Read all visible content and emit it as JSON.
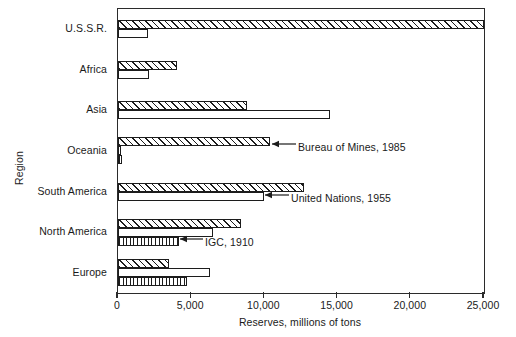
{
  "chart_data": {
    "type": "bar",
    "orientation": "horizontal",
    "title": "",
    "subtitle": "",
    "xlabel": "Reserves, millions of tons",
    "ylabel": "Region",
    "xlim": [
      0,
      25000
    ],
    "xticks": [
      0,
      5000,
      10000,
      15000,
      20000,
      25000
    ],
    "xticklabels": [
      "0",
      "5,000",
      "10,000",
      "15,000",
      "20,000",
      "25,000"
    ],
    "grid": false,
    "legend_position": "inline-annotations",
    "categories": [
      "U.S.S.R.",
      "Africa",
      "Asia",
      "Oceania",
      "South America",
      "North America",
      "Europe"
    ],
    "series": [
      {
        "name": "Bureau of Mines, 1985",
        "pattern": "diagonal-hatch",
        "values": [
          25000,
          4000,
          8800,
          10400,
          12700,
          8400,
          3500
        ]
      },
      {
        "name": "United Nations, 1955",
        "pattern": "dotted",
        "values": [
          2050,
          2100,
          14500,
          200,
          10000,
          6500,
          6300
        ]
      },
      {
        "name": "IGC, 1910",
        "pattern": "vertical-hatch",
        "values": [
          0,
          0,
          0,
          250,
          0,
          4200,
          4700
        ]
      }
    ],
    "annotations": [
      {
        "text": "Bureau of Mines, 1985",
        "series": "Bureau of Mines, 1985",
        "points_to_category": "Oceania"
      },
      {
        "text": "United Nations, 1955",
        "series": "United Nations, 1955",
        "points_to_category": "South America"
      },
      {
        "text": "IGC, 1910",
        "series": "IGC, 1910",
        "points_to_category": "North America"
      }
    ],
    "colors": {
      "line": "#1c1c1c",
      "frame": "#2b2b2b",
      "fill": "#ffffff"
    }
  },
  "axes": {
    "y_title": "Region",
    "x_title": "Reserves, millions of tons"
  },
  "tick_labels": {
    "t0": "0",
    "t1": "5,000",
    "t2": "10,000",
    "t3": "15,000",
    "t4": "20,000",
    "t5": "25,000"
  },
  "category_labels": {
    "c0": "U.S.S.R.",
    "c1": "Africa",
    "c2": "Asia",
    "c3": "Oceania",
    "c4": "South America",
    "c5": "North America",
    "c6": "Europe"
  },
  "annotation_labels": {
    "a0": "Bureau of Mines, 1985",
    "a1": "United Nations, 1955",
    "a2": "IGC, 1910"
  }
}
